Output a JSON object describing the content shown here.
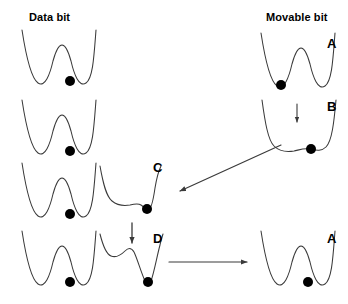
{
  "figure": {
    "type": "diagram",
    "background": "#ffffff",
    "stroke_color": "#3a3a3a",
    "ball_color": "#000000"
  },
  "headers": {
    "data_bit": "Data bit",
    "movable_bit": "Movable bit"
  },
  "state_labels": {
    "a_top": "A",
    "b": "B",
    "c": "C",
    "d": "D",
    "a_bottom": "A"
  },
  "rows": [
    {
      "index": 1,
      "data_bit": {
        "well": "double",
        "ball": "right"
      },
      "middle": null,
      "movable_bit": {
        "well": "double",
        "ball": "left",
        "label": "A"
      }
    },
    {
      "index": 2,
      "data_bit": {
        "well": "double",
        "ball": "right"
      },
      "middle": null,
      "movable_bit": {
        "well": "flat-single",
        "ball": "right",
        "label": "B",
        "arrow": "down"
      }
    },
    {
      "index": 3,
      "data_bit": {
        "well": "double",
        "ball": "right"
      },
      "middle": {
        "well": "tilted-shoulder",
        "ball": "right",
        "label": "C"
      },
      "movable_bit": null
    },
    {
      "index": 4,
      "data_bit": {
        "well": "double",
        "ball": "right"
      },
      "middle": {
        "well": "deep-right",
        "ball": "bottom",
        "label": "D",
        "arrow": "down"
      },
      "movable_bit": {
        "well": "double",
        "ball": "right",
        "label": "A"
      }
    }
  ],
  "arrows": [
    {
      "name": "b-to-c",
      "direction": "diagonal-down-left"
    },
    {
      "name": "d-to-a",
      "direction": "horizontal-right"
    },
    {
      "name": "barrier-lower-b",
      "direction": "down"
    },
    {
      "name": "barrier-raise-d",
      "direction": "down"
    }
  ]
}
